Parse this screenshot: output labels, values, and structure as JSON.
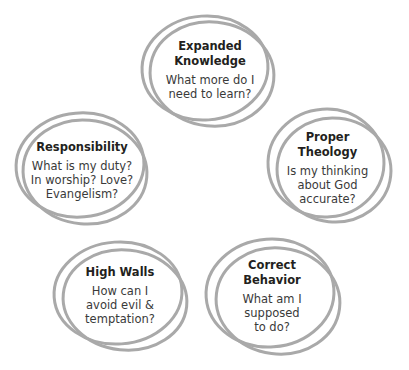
{
  "diagram": {
    "ring_color": "#a9a9a9",
    "text_color": "#231f20",
    "nodes": [
      {
        "id": "expanded-knowledge",
        "title": [
          "Expanded",
          "Knowledge"
        ],
        "question": [
          "What more do I",
          "need to learn?"
        ],
        "position": "top"
      },
      {
        "id": "responsibility",
        "title": [
          "Responsibility"
        ],
        "question": [
          "What is my duty?",
          "In worship? Love?",
          "Evangelism?"
        ],
        "position": "left"
      },
      {
        "id": "proper-theology",
        "title": [
          "Proper",
          "Theology"
        ],
        "question": [
          "Is my thinking",
          "about God",
          "accurate?"
        ],
        "position": "right"
      },
      {
        "id": "high-walls",
        "title": [
          "High Walls"
        ],
        "question": [
          "How can I",
          "avoid evil &",
          "temptation?"
        ],
        "position": "bottom-left"
      },
      {
        "id": "correct-behavior",
        "title": [
          "Correct",
          "Behavior"
        ],
        "question": [
          "What am I",
          "supposed",
          "to do?"
        ],
        "position": "bottom-right"
      }
    ]
  }
}
